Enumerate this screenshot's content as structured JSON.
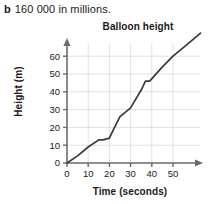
{
  "question": {
    "label": "b",
    "text": "160 000 in millions."
  },
  "chart_data": {
    "type": "line",
    "title": "Balloon height",
    "xlabel": "Time (seconds)",
    "ylabel": "Height (m)",
    "xlim": [
      0,
      55
    ],
    "ylim": [
      0,
      65
    ],
    "xticks": [
      0,
      10,
      20,
      30,
      40,
      50
    ],
    "yticks": [
      0,
      10,
      20,
      30,
      40,
      50,
      60
    ],
    "grid": true,
    "legend": "none",
    "line_color": "#3a3a3a",
    "grid_color": "#d9d9d9",
    "axis_color": "#6b6b6b",
    "series": [
      {
        "name": "Balloon height",
        "x": [
          0,
          5,
          10,
          15,
          17,
          20,
          22,
          25,
          30,
          35,
          37,
          39,
          45,
          50,
          55,
          63
        ],
        "y": [
          0,
          4,
          9,
          13,
          13,
          14,
          19,
          26,
          31,
          41,
          46,
          46,
          54,
          60,
          65,
          73
        ]
      }
    ]
  }
}
